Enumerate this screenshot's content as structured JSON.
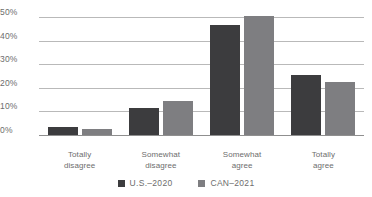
{
  "chart_data": {
    "type": "bar",
    "title": "",
    "subtitle": "",
    "xlabel": "",
    "ylabel": "",
    "categories": [
      "Totally disagree",
      "Somewhat disagree",
      "Somewhat agree",
      "Totally agree"
    ],
    "category_lines": [
      [
        "Totally",
        "disagree"
      ],
      [
        "Somewhat",
        "disagree"
      ],
      [
        "Somewhat",
        "agree"
      ],
      [
        "Totally",
        "agree"
      ]
    ],
    "series": [
      {
        "name": "U.S.–2020",
        "color": "#3c3c3e",
        "values": [
          4,
          12,
          47,
          26
        ]
      },
      {
        "name": "CAN–2021",
        "color": "#7e7e81",
        "values": [
          3,
          15,
          51,
          23
        ]
      }
    ],
    "ylim": [
      0,
      50
    ],
    "yticks": [
      0,
      10,
      20,
      30,
      40,
      50
    ],
    "ytick_labels": [
      "0%",
      "10%",
      "20%",
      "30%",
      "40%",
      "50%"
    ],
    "grid": true,
    "legend_position": "bottom",
    "annotations": []
  },
  "colors": {
    "grid": "#b9b9b9",
    "axis": "#8f8f8f",
    "text": "#6d6d6d",
    "background": "#ffffff"
  }
}
